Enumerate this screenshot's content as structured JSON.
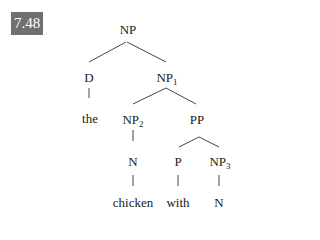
{
  "figure": {
    "label": "7.48",
    "label_bg_color": "#707070"
  },
  "tree": {
    "nodes": [
      {
        "id": "np_root",
        "label": "NP",
        "sub": "",
        "x": 128,
        "y": 29
      },
      {
        "id": "d",
        "label": "D",
        "sub": "",
        "x": 89,
        "y": 77
      },
      {
        "id": "np1",
        "label": "NP",
        "sub": "1",
        "x": 167,
        "y": 77
      },
      {
        "id": "the",
        "label": "the",
        "sub": "",
        "x": 90,
        "y": 118
      },
      {
        "id": "np2",
        "label": "NP",
        "sub": "2",
        "x": 133,
        "y": 119
      },
      {
        "id": "pp",
        "label": "PP",
        "sub": "",
        "x": 197,
        "y": 119
      },
      {
        "id": "n1",
        "label": "N",
        "sub": "",
        "x": 133,
        "y": 161
      },
      {
        "id": "p",
        "label": "P",
        "sub": "",
        "x": 178,
        "y": 161
      },
      {
        "id": "np3",
        "label": "NP",
        "sub": "3",
        "x": 220,
        "y": 161
      },
      {
        "id": "chicken",
        "label": "chicken",
        "sub": "",
        "x": 133,
        "y": 202
      },
      {
        "id": "with",
        "label": "with",
        "sub": "",
        "x": 178,
        "y": 202
      },
      {
        "id": "n2",
        "label": "N",
        "sub": "",
        "x": 219,
        "y": 202
      }
    ],
    "edges": [
      {
        "from": "np_root",
        "to": "d",
        "x1": 126,
        "y1": 42,
        "x2": 89,
        "y2": 62
      },
      {
        "from": "np_root",
        "to": "np1",
        "x1": 127,
        "y1": 42,
        "x2": 166,
        "y2": 62
      },
      {
        "from": "d",
        "to": "the",
        "x1": 89,
        "y1": 88,
        "x2": 89,
        "y2": 98
      },
      {
        "from": "np1",
        "to": "np2",
        "x1": 166,
        "y1": 88,
        "x2": 133,
        "y2": 104
      },
      {
        "from": "np1",
        "to": "pp",
        "x1": 166,
        "y1": 88,
        "x2": 196,
        "y2": 104
      },
      {
        "from": "np2",
        "to": "n1",
        "x1": 133,
        "y1": 130,
        "x2": 133,
        "y2": 141
      },
      {
        "from": "pp",
        "to": "p",
        "x1": 199,
        "y1": 137,
        "x2": 179,
        "y2": 147
      },
      {
        "from": "pp",
        "to": "np3",
        "x1": 199,
        "y1": 137,
        "x2": 219,
        "y2": 147
      },
      {
        "from": "n1",
        "to": "chicken",
        "x1": 133,
        "y1": 175,
        "x2": 133,
        "y2": 186
      },
      {
        "from": "p",
        "to": "with",
        "x1": 178,
        "y1": 175,
        "x2": 178,
        "y2": 186
      },
      {
        "from": "np3",
        "to": "n2",
        "x1": 219,
        "y1": 175,
        "x2": 219,
        "y2": 186
      }
    ]
  }
}
